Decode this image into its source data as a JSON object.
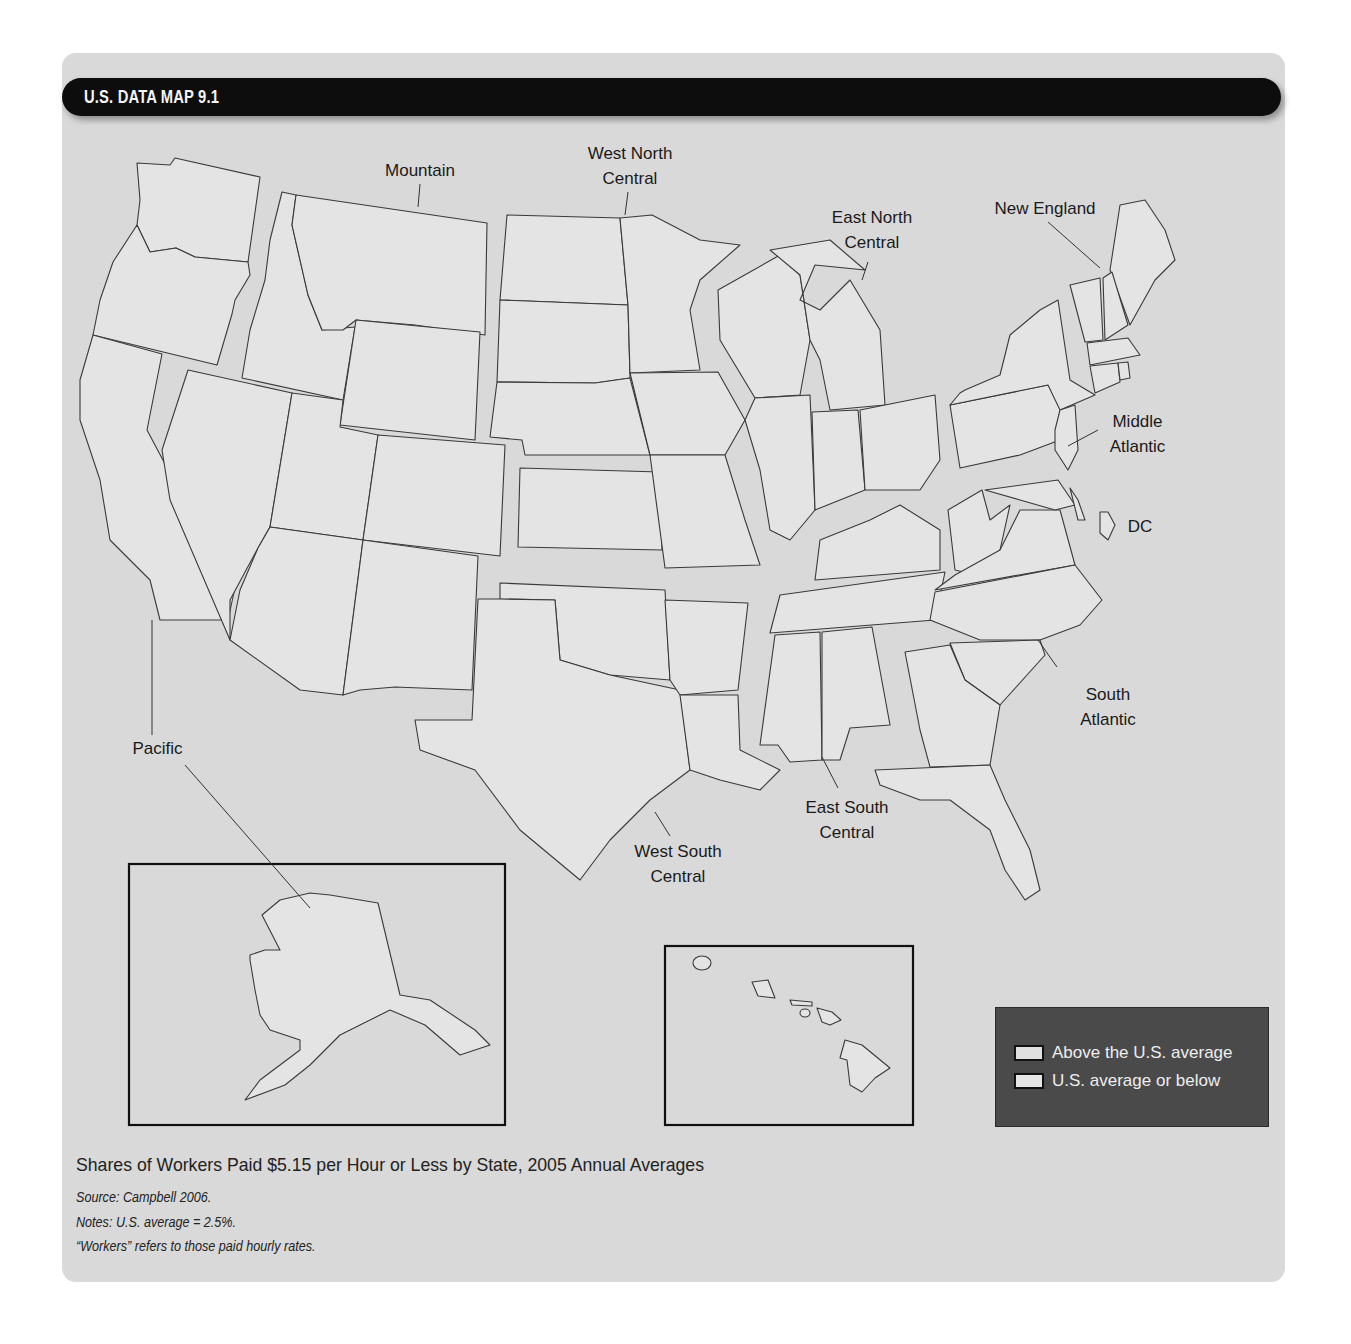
{
  "header": {
    "title": "U.S. DATA MAP 9.1"
  },
  "regions": [
    {
      "id": "pacific",
      "label": "Pacific"
    },
    {
      "id": "mountain",
      "label": "Mountain"
    },
    {
      "id": "west_north_central",
      "label": "West North Central"
    },
    {
      "id": "east_north_central",
      "label": "East North Central"
    },
    {
      "id": "new_england",
      "label": "New England"
    },
    {
      "id": "middle_atlantic",
      "label": "Middle Atlantic"
    },
    {
      "id": "dc",
      "label": "DC"
    },
    {
      "id": "south_atlantic",
      "label": "South Atlantic"
    },
    {
      "id": "east_south_central",
      "label": "East South Central"
    },
    {
      "id": "west_south_central",
      "label": "West South Central"
    }
  ],
  "labels": {
    "mountain": "Mountain",
    "wnc_1": "West North",
    "wnc_2": "Central",
    "enc_1": "East North",
    "enc_2": "Central",
    "new_england": "New England",
    "ma_1": "Middle",
    "ma_2": "Atlantic",
    "dc": "DC",
    "sa_1": "South",
    "sa_2": "Atlantic",
    "esc_1": "East South",
    "esc_2": "Central",
    "wsc_1": "West South",
    "wsc_2": "Central",
    "pacific": "Pacific"
  },
  "legend": {
    "items": [
      {
        "label": "Above the U.S. average",
        "color": "#e0e0e0"
      },
      {
        "label": "U.S. average or below",
        "color": "#e6e6e6"
      }
    ]
  },
  "caption": {
    "title": "Shares of Workers Paid $5.15 per Hour or Less by State, 2005 Annual Averages",
    "source": "Source: Campbell 2006.",
    "notes": "Notes: U.S. average = 2.5%.",
    "footnote": "“Workers” refers to those paid hourly rates."
  },
  "colors": {
    "panel": "#d9d9d9",
    "title_bar": "#0d0d0d",
    "state_fill": "#e4e4e4",
    "legend_bg": "#4a4a4a"
  }
}
